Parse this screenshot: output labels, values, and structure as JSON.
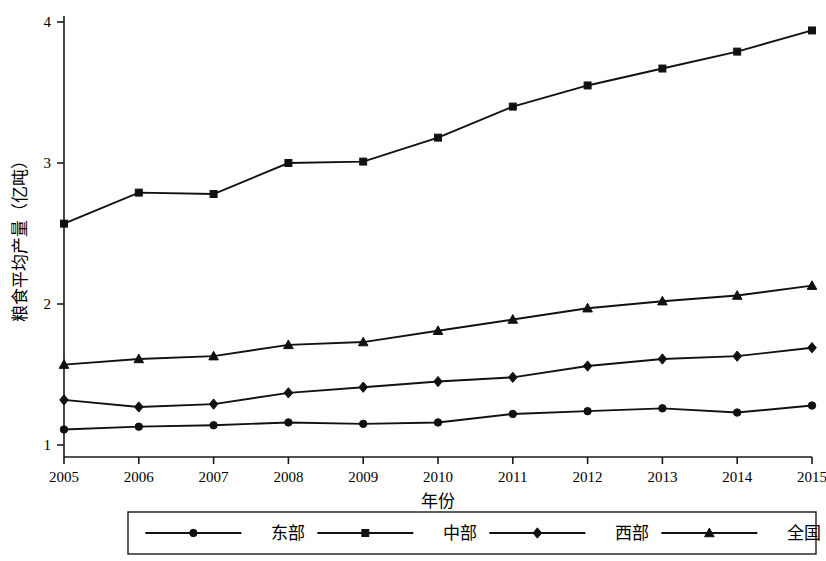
{
  "chart_data": {
    "type": "line",
    "title": "",
    "xlabel": "年份",
    "ylabel": "粮食平均产量（亿吨）",
    "categories": [
      "2005",
      "2006",
      "2007",
      "2008",
      "2009",
      "2010",
      "2011",
      "2012",
      "2013",
      "2014",
      "2015"
    ],
    "x": [
      2005,
      2006,
      2007,
      2008,
      2009,
      2010,
      2011,
      2012,
      2013,
      2014,
      2015
    ],
    "xlim": [
      2005,
      2015
    ],
    "ylim": [
      1,
      4
    ],
    "yticks": [
      "1",
      "2",
      "3",
      "4"
    ],
    "ytick_values": [
      1,
      2,
      3,
      4
    ],
    "grid": false,
    "legend_position": "bottom",
    "series": [
      {
        "name": "东部",
        "marker": "circle",
        "values": [
          1.11,
          1.13,
          1.14,
          1.16,
          1.15,
          1.16,
          1.22,
          1.24,
          1.26,
          1.23,
          1.28
        ]
      },
      {
        "name": "中部",
        "marker": "square",
        "values": [
          2.57,
          2.79,
          2.78,
          3.0,
          3.01,
          3.18,
          3.4,
          3.55,
          3.67,
          3.79,
          3.94
        ]
      },
      {
        "name": "西部",
        "marker": "diamond",
        "values": [
          1.32,
          1.27,
          1.29,
          1.37,
          1.41,
          1.45,
          1.48,
          1.56,
          1.61,
          1.63,
          1.69
        ]
      },
      {
        "name": "全国",
        "marker": "triangle",
        "values": [
          1.57,
          1.61,
          1.63,
          1.71,
          1.73,
          1.81,
          1.89,
          1.97,
          2.02,
          2.06,
          2.13
        ]
      }
    ]
  },
  "legend": {
    "items": [
      {
        "label": "东部",
        "marker": "circle"
      },
      {
        "label": "中部",
        "marker": "square"
      },
      {
        "label": "西部",
        "marker": "diamond"
      },
      {
        "label": "全国",
        "marker": "triangle"
      }
    ]
  },
  "colors": {
    "ink": "#111111",
    "axis": "#1a1a1a",
    "background": "#ffffff"
  }
}
